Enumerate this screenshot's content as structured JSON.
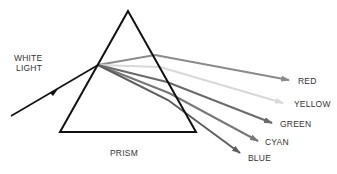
{
  "labels": {
    "white_light_1": "WHITE",
    "white_light_2": "LIGHT",
    "prism": "PRISM",
    "red": "RED",
    "yellow": "YELLOW",
    "green": "GREEN",
    "cyan": "CYAN",
    "blue": "BLUE"
  },
  "colors": {
    "prism_outline": "#111111",
    "incident_ray": "#111111",
    "red_ray": "#8a8a8a",
    "yellow_ray": "#d8d8d8",
    "green_ray": "#6a6a6a",
    "cyan_ray": "#777777",
    "blue_ray": "#5e5e5e"
  }
}
